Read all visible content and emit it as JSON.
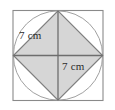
{
  "figure": {
    "name": "square-circle-inscribed-diamond-figure",
    "labels": [
      {
        "id": "diagonal-upper-left",
        "text": "7 cm"
      },
      {
        "id": "diagonal-lower-right",
        "text": "7 cm"
      }
    ],
    "colors": {
      "background": "#ffffff",
      "outer_square_stroke": "#8a8a8a",
      "circle_stroke": "#9a9a9a",
      "diamond_stroke": "#7d7d7d",
      "diamond_fill": "#d6d6d6",
      "diagonal_stroke": "#6e6e6e",
      "label_text": "#2b2b2b"
    },
    "geometry": {
      "outer_square": {
        "x": 13,
        "y": 10.5,
        "width": 90,
        "height": 90
      },
      "circle": {
        "cx": 58,
        "cy": 55.5,
        "r": 45
      },
      "diamond_vertices": [
        {
          "x": 58,
          "y": 10.5
        },
        {
          "x": 103,
          "y": 55.5
        },
        {
          "x": 58,
          "y": 100.5
        },
        {
          "x": 13,
          "y": 55.5
        }
      ],
      "diagonals": [
        {
          "x1": 13,
          "y1": 55.5,
          "x2": 103,
          "y2": 55.5
        },
        {
          "x1": 58,
          "y1": 10.5,
          "x2": 58,
          "y2": 100.5
        }
      ]
    }
  }
}
